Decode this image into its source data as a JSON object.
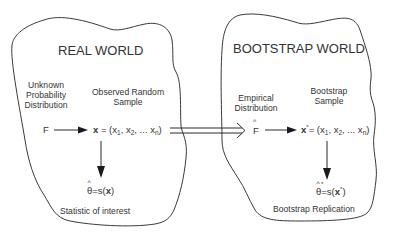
{
  "diagram": {
    "real_world": {
      "title": "REAL WORLD",
      "distribution_label": [
        "Unknown",
        "Probability",
        "Distribution"
      ],
      "sample_label": [
        "Observed Random",
        "Sample"
      ],
      "distribution_symbol": "F",
      "sample_formula": {
        "lhs": "x",
        "eq": " = (x",
        "s1": "1",
        "mid1": ", x",
        "s2": "2",
        "mid2": ", ... x",
        "sn": "n",
        "close": ")"
      },
      "statistic_formula": {
        "theta": "θ",
        "hat": "^",
        "rest": "=s(",
        "arg": "x",
        "close": ")"
      },
      "statistic_label": "Statistic of interest"
    },
    "bootstrap_world": {
      "title": "BOOTSTRAP WORLD",
      "distribution_label": [
        "Empirical",
        "Distribution"
      ],
      "sample_label": [
        "Bootstrap",
        "Sample"
      ],
      "distribution_symbol": "F",
      "distribution_hat": "^",
      "sample_formula": {
        "lhs": "x",
        "star": "*",
        "eq": "= (x",
        "s1": "1",
        "mid1": ", x",
        "s2": "2",
        "mid2": ", ... x",
        "sn": "n",
        "close": ")"
      },
      "statistic_formula": {
        "theta": "θ",
        "hat": "^",
        "star": "*",
        "rest": "=s(",
        "arg": "x",
        "close": ")"
      },
      "statistic_label": "Bootstrap Replication"
    },
    "colors": {
      "ink": "#333333",
      "outline": "#3a3a3a",
      "background": "#ffffff"
    }
  }
}
